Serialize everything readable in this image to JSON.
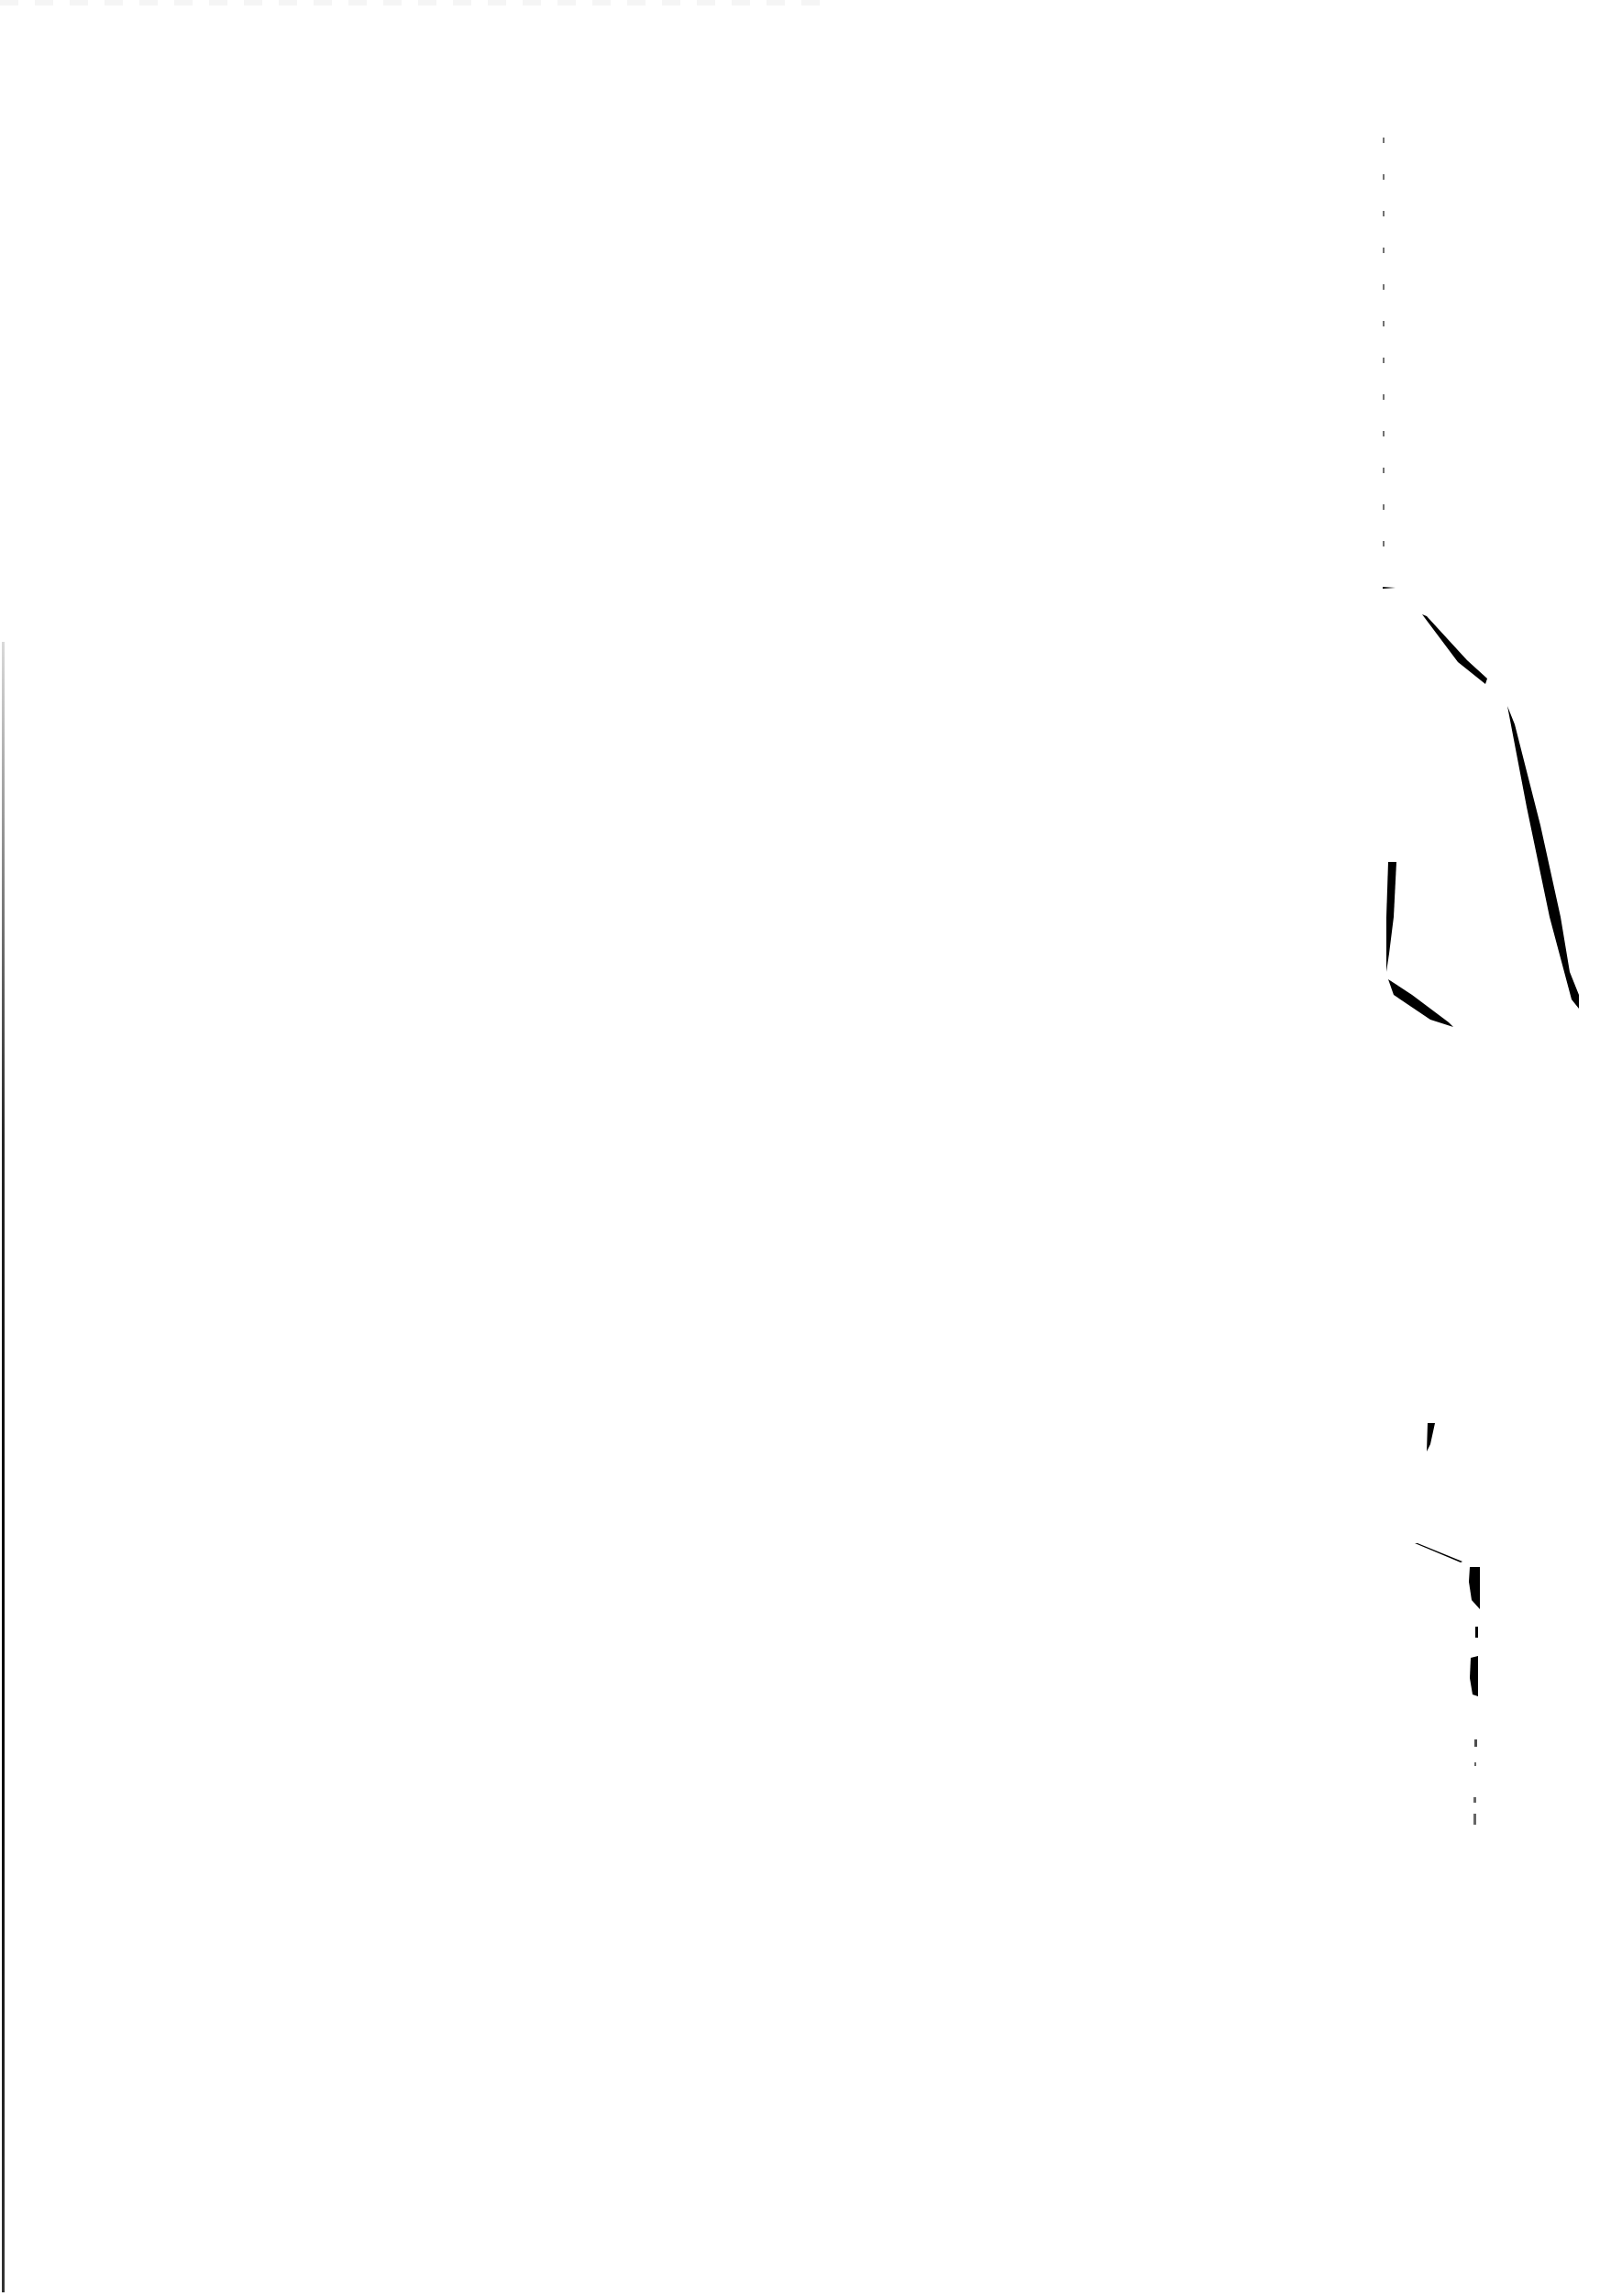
{
  "document": {
    "type": "scanned-page",
    "content": "",
    "background_color": "#ffffff",
    "artifact_color": "#000000"
  }
}
